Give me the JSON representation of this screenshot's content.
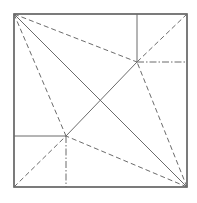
{
  "diagram": {
    "type": "origami-crease-pattern",
    "stroke_color": "#6b6b6b",
    "border_color": "#5a5a5a",
    "background": "#ffffff",
    "square": {
      "x1": 14,
      "y1": 14,
      "x2": 187,
      "y2": 187
    },
    "points": {
      "upper_right": {
        "x": 137,
        "y": 62
      },
      "lower_left": {
        "x": 66,
        "y": 136
      }
    },
    "lines": [
      {
        "id": "diag-main",
        "style": "solid",
        "x1": 14,
        "y1": 14,
        "x2": 187,
        "y2": 187
      },
      {
        "id": "ur-to-tl",
        "style": "dashed",
        "x1": 14,
        "y1": 14,
        "x2": 137,
        "y2": 62
      },
      {
        "id": "ur-to-tr",
        "style": "dashed",
        "x1": 187,
        "y1": 14,
        "x2": 137,
        "y2": 62
      },
      {
        "id": "ur-to-br",
        "style": "dashed",
        "x1": 187,
        "y1": 187,
        "x2": 137,
        "y2": 62
      },
      {
        "id": "ur-to-ll",
        "style": "solid",
        "x1": 137,
        "y1": 62,
        "x2": 66,
        "y2": 136
      },
      {
        "id": "ur-vertical",
        "style": "solid",
        "x1": 137,
        "y1": 14,
        "x2": 137,
        "y2": 62
      },
      {
        "id": "ur-horizontal",
        "style": "dashdot",
        "x1": 137,
        "y1": 62,
        "x2": 187,
        "y2": 62
      },
      {
        "id": "ll-to-tl",
        "style": "dashed",
        "x1": 14,
        "y1": 14,
        "x2": 66,
        "y2": 136
      },
      {
        "id": "ll-to-bl",
        "style": "dashed",
        "x1": 14,
        "y1": 187,
        "x2": 66,
        "y2": 136
      },
      {
        "id": "ll-to-br",
        "style": "dashed",
        "x1": 187,
        "y1": 187,
        "x2": 66,
        "y2": 136
      },
      {
        "id": "ll-horizontal",
        "style": "solid",
        "x1": 14,
        "y1": 136,
        "x2": 66,
        "y2": 136
      },
      {
        "id": "ll-vertical",
        "style": "dashdot",
        "x1": 66,
        "y1": 136,
        "x2": 66,
        "y2": 187
      }
    ]
  }
}
